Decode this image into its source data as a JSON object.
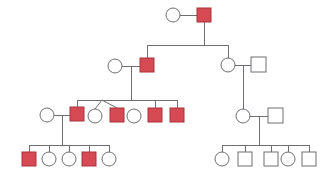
{
  "figure": {
    "name": "pedigree-chart",
    "type": "pedigree",
    "background_color": "#ffffff",
    "line_color": "#6e6e73",
    "affected_fill": "#d64a53",
    "affected_stroke": "#a8343c",
    "unaffected_fill": "#ffffff",
    "unaffected_stroke": "#6e6e73",
    "width": 333,
    "height": 178,
    "legend": {
      "square_meaning": "male",
      "circle_meaning": "female",
      "filled_meaning": "affected",
      "open_meaning": "unaffected"
    }
  },
  "generations": [
    {
      "id": "I",
      "label": "",
      "y": 15,
      "individuals": [
        {
          "id": "I-1",
          "shape": "circle",
          "sex": "female",
          "affected": false,
          "cx": 173,
          "cy": 15,
          "r": 7
        },
        {
          "id": "I-2",
          "shape": "square",
          "sex": "male",
          "affected": true,
          "x": 197,
          "y": 8,
          "size": 14
        }
      ]
    },
    {
      "id": "II",
      "label": "",
      "y": 65,
      "individuals": [
        {
          "id": "II-1",
          "shape": "circle",
          "sex": "female",
          "affected": false,
          "cx": 115,
          "cy": 66,
          "r": 7
        },
        {
          "id": "II-2",
          "shape": "square",
          "sex": "male",
          "affected": true,
          "x": 140,
          "y": 58,
          "size": 14
        },
        {
          "id": "II-3",
          "shape": "circle",
          "sex": "female",
          "affected": false,
          "cx": 228,
          "cy": 65,
          "r": 7
        },
        {
          "id": "II-4",
          "shape": "square",
          "sex": "male",
          "affected": false,
          "x": 251,
          "y": 57,
          "size": 15
        }
      ]
    },
    {
      "id": "III",
      "label": "",
      "y": 115,
      "individuals": [
        {
          "id": "III-1",
          "shape": "circle",
          "sex": "female",
          "affected": false,
          "cx": 47,
          "cy": 115,
          "r": 7
        },
        {
          "id": "III-2",
          "shape": "square",
          "sex": "male",
          "affected": true,
          "x": 70,
          "y": 107,
          "size": 14
        },
        {
          "id": "III-3",
          "shape": "circle",
          "sex": "female",
          "affected": false,
          "cx": 95,
          "cy": 116,
          "r": 7
        },
        {
          "id": "III-4",
          "shape": "square",
          "sex": "male",
          "affected": true,
          "x": 110,
          "y": 108,
          "size": 14
        },
        {
          "id": "III-5",
          "shape": "circle",
          "sex": "female",
          "affected": false,
          "cx": 134,
          "cy": 116,
          "r": 7
        },
        {
          "id": "III-6",
          "shape": "square",
          "sex": "male",
          "affected": true,
          "x": 148,
          "y": 108,
          "size": 14
        },
        {
          "id": "III-7",
          "shape": "square",
          "sex": "male",
          "affected": true,
          "x": 170,
          "y": 108,
          "size": 14
        },
        {
          "id": "III-8",
          "shape": "circle",
          "sex": "female",
          "affected": false,
          "cx": 243,
          "cy": 116,
          "r": 7
        },
        {
          "id": "III-9",
          "shape": "square",
          "sex": "male",
          "affected": false,
          "x": 268,
          "y": 108,
          "size": 15
        }
      ]
    },
    {
      "id": "IV",
      "label": "",
      "y": 159,
      "individuals": [
        {
          "id": "IV-1",
          "shape": "square",
          "sex": "male",
          "affected": true,
          "x": 22,
          "y": 152,
          "size": 14
        },
        {
          "id": "IV-2",
          "shape": "circle",
          "sex": "female",
          "affected": false,
          "cx": 49,
          "cy": 159,
          "r": 7
        },
        {
          "id": "IV-3",
          "shape": "circle",
          "sex": "female",
          "affected": false,
          "cx": 69,
          "cy": 159,
          "r": 7
        },
        {
          "id": "IV-4",
          "shape": "square",
          "sex": "male",
          "affected": true,
          "x": 82,
          "y": 152,
          "size": 14
        },
        {
          "id": "IV-5",
          "shape": "circle",
          "sex": "female",
          "affected": false,
          "cx": 109,
          "cy": 159,
          "r": 7
        },
        {
          "id": "IV-6",
          "shape": "circle",
          "sex": "female",
          "affected": false,
          "cx": 222,
          "cy": 159,
          "r": 7
        },
        {
          "id": "IV-7",
          "shape": "square",
          "sex": "male",
          "affected": false,
          "x": 238,
          "y": 152,
          "size": 14
        },
        {
          "id": "IV-8",
          "shape": "square",
          "sex": "male",
          "affected": false,
          "x": 264,
          "y": 152,
          "size": 14
        },
        {
          "id": "IV-9",
          "shape": "circle",
          "sex": "female",
          "affected": false,
          "cx": 288,
          "cy": 159,
          "r": 7
        },
        {
          "id": "IV-10",
          "shape": "square",
          "sex": "male",
          "affected": false,
          "x": 302,
          "y": 152,
          "size": 14
        }
      ]
    }
  ],
  "matings": [
    {
      "id": "mating-I",
      "partners": [
        "I-1",
        "I-2"
      ],
      "children": [
        "II-2",
        "II-3"
      ],
      "twin": false
    },
    {
      "id": "mating-II-left",
      "partners": [
        "II-1",
        "II-2"
      ],
      "children": [
        "III-2",
        "III-3",
        "III-4",
        "III-5",
        "III-6",
        "III-7"
      ],
      "twin": true
    },
    {
      "id": "mating-II-right",
      "partners": [
        "II-3",
        "II-4"
      ],
      "children": [
        "III-8"
      ],
      "twin": false
    },
    {
      "id": "mating-III-left",
      "partners": [
        "III-1",
        "III-2"
      ],
      "children": [
        "IV-1",
        "IV-2",
        "IV-3",
        "IV-4",
        "IV-5"
      ],
      "twin": false
    },
    {
      "id": "mating-III-right",
      "partners": [
        "III-8",
        "III-9"
      ],
      "children": [
        "IV-6",
        "IV-7",
        "IV-8",
        "IV-9",
        "IV-10"
      ],
      "twin": false
    }
  ],
  "twin_group": {
    "id": "twin-fork-III",
    "members": [
      "III-3",
      "III-4"
    ],
    "apex_x": 102,
    "apex_y": 100
  },
  "counts": {
    "total_individuals": 25,
    "affected_individuals": 9,
    "affected_males": 9,
    "affected_females": 0,
    "generations": 4
  }
}
